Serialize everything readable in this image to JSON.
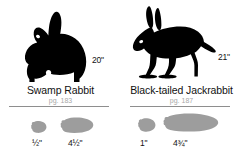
{
  "guide": {
    "species": [
      {
        "id": "swamp-rabbit",
        "name": "Swamp Rabbit",
        "page_ref": "pg. 183",
        "body_height": "20\"",
        "silhouette_icon": "rabbit-sitting-silhouette",
        "tracks": [
          {
            "id": "front",
            "label": "½\"",
            "icon": "front-paw-track-icon"
          },
          {
            "id": "hind",
            "label": "4½\"",
            "icon": "hind-paw-track-icon"
          }
        ]
      },
      {
        "id": "black-tailed-jackrabbit",
        "name": "Black-tailed Jackrabbit",
        "page_ref": "pg. 187",
        "body_height": "21\"",
        "silhouette_icon": "jackrabbit-standing-silhouette",
        "tracks": [
          {
            "id": "front",
            "label": "1\"",
            "icon": "front-paw-track-icon"
          },
          {
            "id": "hind",
            "label": "4¾\"",
            "icon": "hind-paw-track-icon"
          }
        ]
      }
    ],
    "colors": {
      "silhouette": "#000000",
      "track_fill": "#9d9d9d",
      "divider": "#8e8e8e",
      "page_ref_text": "#a8a8a8",
      "primary_text": "#111111",
      "background": "#ffffff"
    }
  }
}
